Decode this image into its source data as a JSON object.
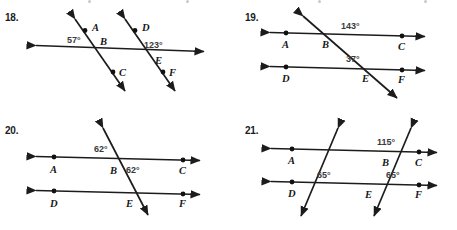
{
  "page": {
    "kind": "geometry-worksheet",
    "ink_color": "#1c1c1c",
    "angle_label_color": "#3a3a3a"
  },
  "problems": [
    {
      "number": "18.",
      "figure": "two parallel transversals crossing one horizontal line",
      "points": [
        {
          "label": "A"
        },
        {
          "label": "B"
        },
        {
          "label": "C"
        },
        {
          "label": "D"
        },
        {
          "label": "E"
        },
        {
          "label": "F"
        }
      ],
      "angles": [
        {
          "value": "57°"
        },
        {
          "value": "123°"
        }
      ]
    },
    {
      "number": "19.",
      "figure": "two horizontal parallel lines cut by one transversal",
      "points": [
        {
          "label": "A"
        },
        {
          "label": "B"
        },
        {
          "label": "C"
        },
        {
          "label": "D"
        },
        {
          "label": "E"
        },
        {
          "label": "F"
        }
      ],
      "angles": [
        {
          "value": "143°"
        },
        {
          "value": "37°"
        }
      ]
    },
    {
      "number": "20.",
      "figure": "two horizontal parallel lines cut by one transversal",
      "points": [
        {
          "label": "A"
        },
        {
          "label": "B"
        },
        {
          "label": "C"
        },
        {
          "label": "D"
        },
        {
          "label": "E"
        },
        {
          "label": "F"
        }
      ],
      "angles": [
        {
          "value": "62°"
        },
        {
          "value": "62°"
        }
      ]
    },
    {
      "number": "21.",
      "figure": "two horizontal parallel lines cut by two parallel transversals",
      "points": [
        {
          "label": "A"
        },
        {
          "label": "B"
        },
        {
          "label": "C"
        },
        {
          "label": "D"
        },
        {
          "label": "E"
        },
        {
          "label": "F"
        }
      ],
      "angles": [
        {
          "value": "115°"
        },
        {
          "value": "65°"
        },
        {
          "value": "65°"
        }
      ]
    }
  ]
}
